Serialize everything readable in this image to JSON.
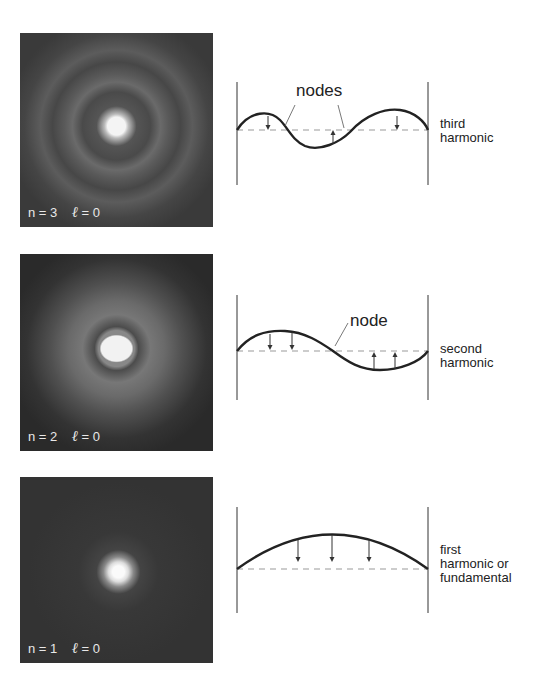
{
  "panels": [
    {
      "photo": {
        "n_label": "n = 3",
        "l_symbol": "ℓ",
        "l_label": "= 0"
      },
      "diagram": {
        "annotation": "nodes"
      },
      "caption": "third\nharmonic"
    },
    {
      "photo": {
        "n_label": "n = 2",
        "l_symbol": "ℓ",
        "l_label": "= 0"
      },
      "diagram": {
        "annotation": "node"
      },
      "caption": "second\nharmonic"
    },
    {
      "photo": {
        "n_label": "n = 1",
        "l_symbol": "ℓ",
        "l_label": "= 0"
      },
      "diagram": {
        "annotation": ""
      },
      "caption": "first\nharmonic or\nfundamental"
    }
  ]
}
